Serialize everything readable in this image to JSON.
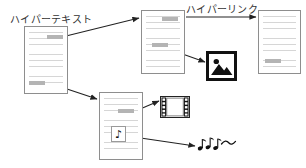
{
  "diagram": {
    "title_labels": {
      "hypertext": "ハイパーテキスト",
      "hyperlink": "ハイパーリンク"
    },
    "colors": {
      "page_border": "#8e8e8e",
      "text_line": "#d6d6d6",
      "anchor_highlight": "#b4b4b4",
      "arrow": "#222222",
      "icon_black": "#111111",
      "background": "#ffffff"
    },
    "documents": [
      {
        "id": "doc-hypertext-source",
        "name": "source-document",
        "x": 24,
        "y": 26,
        "w": 44,
        "h": 68,
        "line_count": 8,
        "anchors": [
          {
            "name": "anchor-to-document-2",
            "x": 22,
            "y": 8,
            "w": 16
          },
          {
            "name": "anchor-to-document-4",
            "x": 4,
            "y": 54,
            "w": 16
          }
        ]
      },
      {
        "id": "doc-linked-second",
        "name": "second-document",
        "x": 141,
        "y": 10,
        "w": 44,
        "h": 64,
        "line_count": 8,
        "anchors": [
          {
            "name": "anchor-to-document-3",
            "x": 20,
            "y": 6,
            "w": 16
          },
          {
            "name": "anchor-to-image",
            "x": 10,
            "y": 32,
            "w": 16
          }
        ]
      },
      {
        "id": "doc-linked-third",
        "name": "third-document",
        "x": 258,
        "y": 10,
        "w": 43,
        "h": 64,
        "line_count": 8,
        "anchors": [
          {
            "name": "anchor-plain",
            "x": 6,
            "y": 48,
            "w": 16
          }
        ]
      },
      {
        "id": "doc-multimedia",
        "name": "multimedia-document",
        "x": 99,
        "y": 92,
        "w": 44,
        "h": 68,
        "line_count": 8,
        "anchors": [
          {
            "name": "anchor-to-video",
            "x": 18,
            "y": 16,
            "w": 16
          }
        ]
      }
    ],
    "media": [
      {
        "id": "image-icon",
        "name": "image-media-icon",
        "kind": "image",
        "x": 206,
        "y": 51,
        "w": 31,
        "h": 30,
        "glyph": "picture-mountain-sun"
      },
      {
        "id": "film-icon",
        "name": "video-media-icon",
        "kind": "video",
        "x": 160,
        "y": 96,
        "w": 30,
        "h": 22,
        "glyph": "film-strip"
      },
      {
        "id": "note-embed",
        "name": "audio-embed-icon",
        "kind": "audio-embed",
        "x": 111,
        "y": 126,
        "w": 15,
        "h": 16,
        "glyph": "♪"
      },
      {
        "id": "sound-waves",
        "name": "audio-output-notes",
        "kind": "audio",
        "x": 197,
        "y": 135,
        "w": 40,
        "h": 18,
        "glyph": "musical-notes-wave"
      }
    ],
    "connections": [
      {
        "name": "link-doc1-to-doc2",
        "from": "doc-hypertext-source",
        "to": "doc-linked-second",
        "x1": 62,
        "y1": 37,
        "x2": 139,
        "y2": 18
      },
      {
        "name": "link-doc2-to-doc3",
        "from": "doc-linked-second",
        "to": "doc-linked-third",
        "x1": 186,
        "y1": 17,
        "x2": 256,
        "y2": 17
      },
      {
        "name": "link-doc2-to-image",
        "from": "doc-linked-second",
        "to": "image-icon",
        "x1": 160,
        "y1": 46,
        "x2": 205,
        "y2": 62
      },
      {
        "name": "link-doc1-to-doc4",
        "from": "doc-hypertext-source",
        "to": "doc-multimedia",
        "x1": 52,
        "y1": 84,
        "x2": 97,
        "y2": 99
      },
      {
        "name": "link-doc4-to-video",
        "from": "doc-multimedia",
        "to": "film-icon",
        "x1": 133,
        "y1": 112,
        "x2": 159,
        "y2": 101
      },
      {
        "name": "link-doc4-to-audio",
        "from": "doc-multimedia",
        "to": "sound-waves",
        "x1": 127,
        "y1": 136,
        "x2": 195,
        "y2": 146
      }
    ],
    "label_positions": {
      "hypertext": {
        "x": 10,
        "y": 11
      },
      "hyperlink": {
        "x": 186,
        "y": 1
      }
    }
  }
}
